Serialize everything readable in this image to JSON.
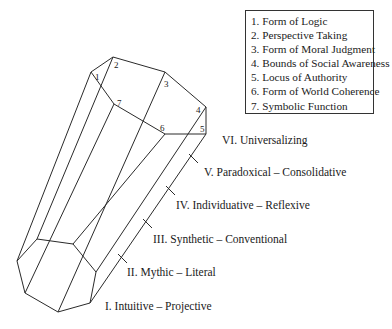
{
  "legend": {
    "items": [
      {
        "num": "1.",
        "label": "Form of Logic"
      },
      {
        "num": "2.",
        "label": "Perspective Taking"
      },
      {
        "num": "3.",
        "label": "Form of Moral Judgment"
      },
      {
        "num": "4.",
        "label": "Bounds of Social Awareness"
      },
      {
        "num": "5.",
        "label": "Locus of Authority"
      },
      {
        "num": "6.",
        "label": "Form of World Coherence"
      },
      {
        "num": "7.",
        "label": "Symbolic Function"
      }
    ]
  },
  "face_numbers": [
    "1",
    "2",
    "3",
    "4",
    "5",
    "6",
    "7"
  ],
  "stages": [
    {
      "label": "VI. Universalizing"
    },
    {
      "label": "V. Paradoxical – Consolidative"
    },
    {
      "label": "IV. Individuative – Reflexive"
    },
    {
      "label": "III. Synthetic – Conventional"
    },
    {
      "label": "II. Mythic – Literal"
    },
    {
      "label": "I. Intuitive – Projective"
    }
  ],
  "colors": {
    "line": "#2a2a2a",
    "background": "#ffffff"
  }
}
